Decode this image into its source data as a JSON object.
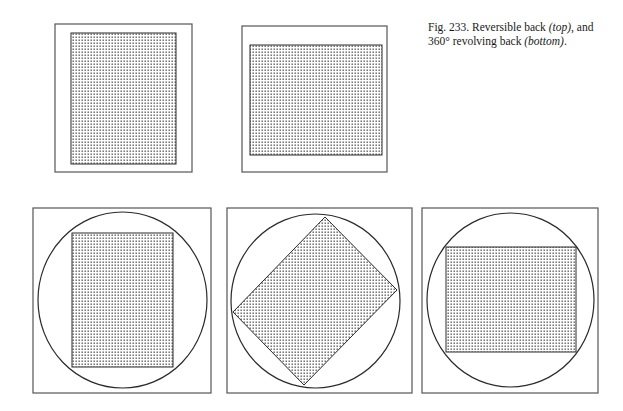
{
  "caption": {
    "prefix": "Fig. 233. Reversible back ",
    "top_label": "(top)",
    "middle": ", and 360° revolving back ",
    "bottom_label": "(bottom)",
    "suffix": "."
  },
  "colors": {
    "line": "#2a2a2a",
    "frame": "#555555",
    "dot": "#4a4a4a",
    "background": "#ffffff"
  },
  "panels": {
    "top_row": [
      {
        "name": "reversible-back-portrait",
        "orientation": "portrait"
      },
      {
        "name": "reversible-back-landscape",
        "orientation": "landscape"
      }
    ],
    "bottom_row": [
      {
        "name": "revolving-back-portrait",
        "rotation_deg": 0
      },
      {
        "name": "revolving-back-tilted",
        "rotation_deg": 45
      },
      {
        "name": "revolving-back-landscape",
        "rotation_deg": 90
      }
    ]
  }
}
